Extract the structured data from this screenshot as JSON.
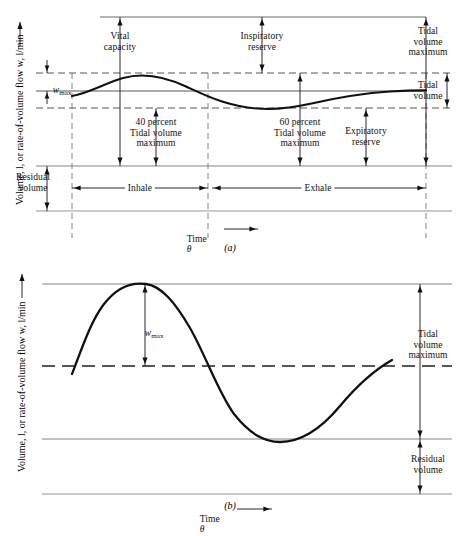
{
  "figure": {
    "axis_label_y": "Volume, l, or rate-of-volume flow w, l/min",
    "axis_label_time": "Time",
    "axis_symbol_theta": "θ"
  },
  "panel_a": {
    "caption": "(a)",
    "labels": {
      "vital_capacity": "Vital\ncapacity",
      "inspiratory_reserve": "Inspiratory\nreserve",
      "tidal_volume_maximum": "Tidal\nvolume\nmaximum",
      "tidal_volume": "Tidal\nvolume",
      "w_max_symbol": "w",
      "w_max_subscript": "max",
      "pct40": "40 percent\nTidal volume\nmaximum",
      "pct60": "60 percent\nTidal volume\nmaximum",
      "expiratory_reserve": "Expiratory\nreserve",
      "residual_volume": "Residual\nvolume",
      "inhale": "Inhale",
      "exhale": "Exhale"
    }
  },
  "panel_b": {
    "caption": "(b)",
    "labels": {
      "w_max_symbol": "w",
      "w_max_subscript": "max",
      "tidal_volume_maximum": "Tidal\nvolume\nmaximum",
      "residual_volume": "Residual\nvolume"
    }
  },
  "chart_data": [
    {
      "id": "panel-a",
      "type": "line",
      "title": "(a) Tidal volume oscillation about mean lung volume",
      "xlabel": "Time θ",
      "ylabel": "Volume, l, or rate-of-volume flow w, l/min",
      "grid": false,
      "legend": "none",
      "xlim": [
        0,
        1
      ],
      "ylim": [
        0,
        1
      ],
      "annotations": [
        "Vital capacity",
        "Inspiratory reserve",
        "Tidal volume maximum",
        "Tidal volume",
        "40 percent Tidal volume maximum",
        "60 percent Tidal volume maximum",
        "Expiratory reserve",
        "Residual volume",
        "Inhale",
        "Exhale",
        "w max"
      ],
      "series": [
        {
          "name": "volume",
          "description": "Sinusoidal tidal volume: rises through inhale to tidal volume maximum at 40 percent, falls through exhale to minimum at 60 percent.",
          "x": [
            0.0,
            0.05,
            0.1,
            0.15,
            0.2,
            0.25,
            0.3,
            0.35,
            0.4,
            0.45,
            0.5,
            0.55,
            0.6,
            0.65,
            0.7,
            0.75,
            0.8,
            0.85,
            0.9,
            0.95,
            1.0
          ],
          "y": [
            0.0,
            0.3,
            0.59,
            0.81,
            0.95,
            1.0,
            0.95,
            0.81,
            0.59,
            0.31,
            0.0,
            -0.31,
            -0.59,
            -0.81,
            -0.95,
            -1.0,
            -0.95,
            -0.81,
            -0.59,
            -0.31,
            0.0
          ]
        }
      ],
      "reference_levels": [
        {
          "name": "Tidal volume maximum level",
          "style": "dashed"
        },
        {
          "name": "Mean volume level",
          "style": "solid"
        },
        {
          "name": "Tidal volume minimum level",
          "style": "dashed"
        },
        {
          "name": "Residual volume top",
          "style": "solid"
        },
        {
          "name": "Baseline",
          "style": "solid"
        }
      ],
      "phase_markers": [
        {
          "label": "Inhale",
          "start": 0.0,
          "end": 0.4
        },
        {
          "label": "Exhale",
          "start": 0.4,
          "end": 1.0
        }
      ]
    },
    {
      "id": "panel-b",
      "type": "line",
      "title": "(b) Rate-of-volume flow w versus time",
      "xlabel": "Time θ",
      "ylabel": "Volume, l, or rate-of-volume flow w, l/min",
      "grid": false,
      "legend": "none",
      "xlim": [
        0,
        1
      ],
      "ylim": [
        -1,
        1
      ],
      "annotations": [
        "w max",
        "Tidal volume maximum",
        "Residual volume"
      ],
      "series": [
        {
          "name": "flow",
          "description": "Full sine wave: peaks at w max early, crosses mean, troughs at residual volume level, rises again.",
          "x": [
            0.0,
            0.05,
            0.1,
            0.15,
            0.2,
            0.25,
            0.3,
            0.35,
            0.4,
            0.45,
            0.5,
            0.55,
            0.6,
            0.65,
            0.7,
            0.75,
            0.8,
            0.85,
            0.9,
            0.95,
            1.0
          ],
          "y": [
            -0.2,
            0.25,
            0.63,
            0.89,
            1.0,
            0.97,
            0.8,
            0.52,
            0.16,
            -0.22,
            -0.57,
            -0.83,
            -0.97,
            -1.0,
            -0.95,
            -0.8,
            -0.55,
            -0.22,
            0.12,
            0.4,
            0.52
          ]
        }
      ],
      "reference_levels": [
        {
          "name": "Tidal volume maximum level",
          "style": "solid"
        },
        {
          "name": "Mean level",
          "style": "dashed"
        },
        {
          "name": "Residual volume top",
          "style": "solid"
        },
        {
          "name": "Baseline",
          "style": "solid"
        }
      ]
    }
  ]
}
